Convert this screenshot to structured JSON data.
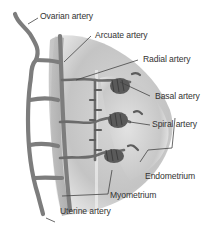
{
  "labels": {
    "ovarian": "Ovarian artery",
    "arcuate": "Arcuate artery",
    "radial": "Radial artery",
    "basal": "Basal artery",
    "spiral": "Spiral artery",
    "endometrium": "Endometrium",
    "myometrium": "Myometrium",
    "uterine": "Uterine artery"
  },
  "colors": {
    "vessel": "#7a7a7a",
    "vessel_dark": "#4e4e4e",
    "tissue_light": "#e9e9e9",
    "tissue_mid": "#c9c9c9",
    "text": "#333333",
    "leader": "#444444"
  }
}
